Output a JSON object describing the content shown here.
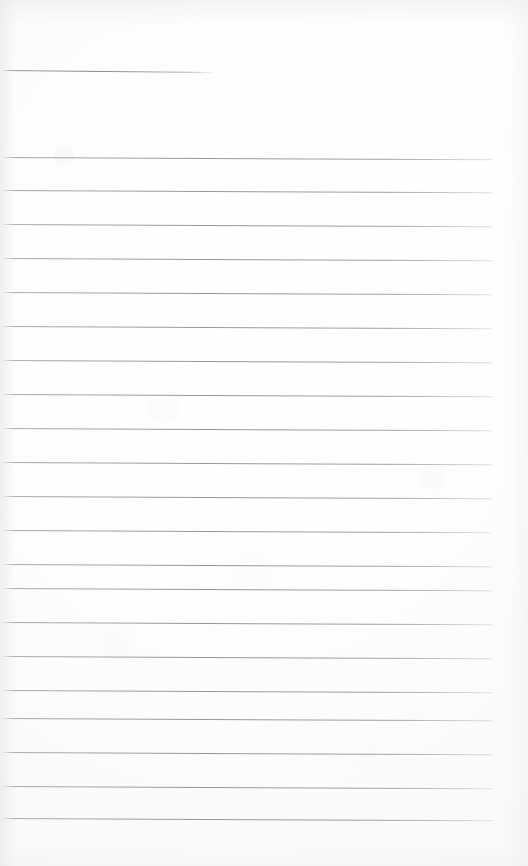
{
  "document": {
    "type": "lined-notebook-page",
    "title": "",
    "visible_text": "",
    "page_width": 528,
    "page_height": 866,
    "paper_color": "#fdfdfd",
    "rule_color": "#8e90989",
    "rule_color_hex": "#8e9098",
    "content": {
      "is_blank": true,
      "handwriting_present": false,
      "printed_text_present": false
    },
    "header_rule": {
      "name": "header-rule",
      "y": 70,
      "x_start": 2,
      "x_end": 213,
      "slope_px": 2
    },
    "body_rules": [
      {
        "y": 157,
        "x_start": 2,
        "x_end": 493
      },
      {
        "y": 190,
        "x_start": 2,
        "x_end": 493
      },
      {
        "y": 224,
        "x_start": 2,
        "x_end": 492
      },
      {
        "y": 258,
        "x_start": 2,
        "x_end": 493
      },
      {
        "y": 292,
        "x_start": 2,
        "x_end": 492
      },
      {
        "y": 326,
        "x_start": 2,
        "x_end": 491
      },
      {
        "y": 360,
        "x_start": 2,
        "x_end": 492
      },
      {
        "y": 394,
        "x_start": 2,
        "x_end": 492
      },
      {
        "y": 428,
        "x_start": 2,
        "x_end": 491
      },
      {
        "y": 462,
        "x_start": 2,
        "x_end": 492
      },
      {
        "y": 496,
        "x_start": 2,
        "x_end": 492
      },
      {
        "y": 530,
        "x_start": 2,
        "x_end": 491
      },
      {
        "y": 564,
        "x_start": 2,
        "x_end": 492
      },
      {
        "y": 588,
        "x_start": 2,
        "x_end": 492
      },
      {
        "y": 622,
        "x_start": 2,
        "x_end": 492
      },
      {
        "y": 656,
        "x_start": 2,
        "x_end": 492
      },
      {
        "y": 690,
        "x_start": 2,
        "x_end": 492
      },
      {
        "y": 718,
        "x_start": 2,
        "x_end": 493
      },
      {
        "y": 752,
        "x_start": 2,
        "x_end": 493
      },
      {
        "y": 786,
        "x_start": 2,
        "x_end": 492
      },
      {
        "y": 818,
        "x_start": 2,
        "x_end": 493
      }
    ],
    "margins": {
      "right_white_px": 35,
      "bottom_white_px": 48,
      "top_white_px": 68
    }
  }
}
